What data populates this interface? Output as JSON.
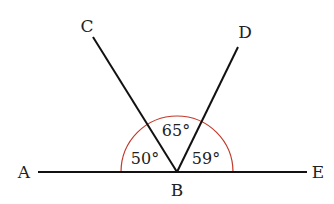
{
  "diagram": {
    "points": {
      "A": {
        "label": "A",
        "x": 24,
        "y": 178
      },
      "B": {
        "label": "B",
        "x": 177,
        "y": 196
      },
      "C": {
        "label": "C",
        "x": 87,
        "y": 32
      },
      "D": {
        "label": "D",
        "x": 245,
        "y": 38
      },
      "E": {
        "label": "E",
        "x": 318,
        "y": 178
      }
    },
    "vertex": {
      "x": 177,
      "y": 172
    },
    "angles": [
      {
        "name": "angle-ABC",
        "label": "50°",
        "x": 145,
        "y": 164
      },
      {
        "name": "angle-CBD",
        "label": "65°",
        "x": 176,
        "y": 136
      },
      {
        "name": "angle-DBE",
        "label": "59°",
        "x": 206,
        "y": 164
      }
    ],
    "colors": {
      "line": "#111111",
      "arc": "#c0392b",
      "text": "#222222"
    }
  }
}
